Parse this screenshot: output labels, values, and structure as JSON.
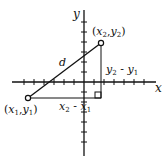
{
  "diagram": {
    "axes": {
      "x_label": "x",
      "y_label": "y"
    },
    "points": [
      {
        "id": "p1",
        "label_var_x": "x",
        "label_sub_x": "1",
        "label_var_y": "y",
        "label_sub_y": "1"
      },
      {
        "id": "p2",
        "label_var_x": "x",
        "label_sub_x": "2",
        "label_var_y": "y",
        "label_sub_y": "2"
      }
    ],
    "segment_label": "d",
    "horizontal_leg": {
      "a": "x",
      "a_sub": "2",
      "op": " - ",
      "b": "x",
      "b_sub": "1"
    },
    "vertical_leg": {
      "a": "y",
      "a_sub": "2",
      "op": " - ",
      "b": "y",
      "b_sub": "1"
    },
    "colors": {
      "ink": "#111111",
      "background": "#ffffff"
    }
  }
}
